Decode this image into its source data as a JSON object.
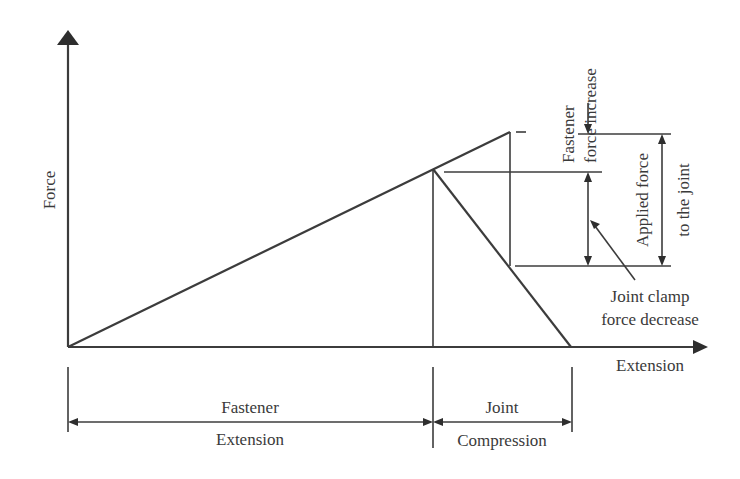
{
  "diagram": {
    "axes": {
      "y_label": "Force",
      "x_label": "Extension"
    },
    "annotations": {
      "fastener_force_increase": [
        "Fastener",
        "force increase"
      ],
      "applied_force": [
        "Applied force",
        "to the joint"
      ],
      "joint_clamp_force_decrease": [
        "Joint clamp",
        "force decrease"
      ]
    },
    "dimensions": {
      "fastener": {
        "top": "Fastener",
        "bottom": "Extension"
      },
      "joint": {
        "top": "Joint",
        "bottom": "Compression"
      }
    },
    "colors": {
      "line": "#3c3c3c",
      "text": "#3a3a3a",
      "background": "#ffffff"
    }
  }
}
